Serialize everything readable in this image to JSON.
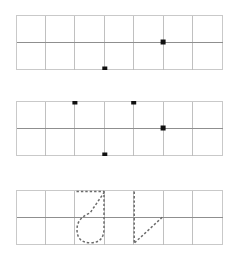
{
  "worksheet": {
    "title": "Handwriting practice grid worksheet",
    "background_color": "#ffffff",
    "grid_line_color": "#b9b9b9",
    "midline_color": "#8f8f8f",
    "dot_color": "#111111",
    "guide_stroke_color": "#6b6b6b",
    "columns": 7,
    "rows": 2,
    "row_count": 3,
    "geometry": {
      "left": 16,
      "right": 222,
      "width": 206,
      "col_width": 29.43,
      "row_heights": [
        27,
        27
      ],
      "band_tops": [
        15,
        101,
        190
      ],
      "band_height": 54
    },
    "bands": [
      {
        "name": "band-one",
        "index": 1,
        "top": 15,
        "dots": [
          {
            "name": "dot-mid-col6",
            "col": 5,
            "line": "middle",
            "x": 163.1,
            "y": 42
          },
          {
            "name": "dot-bottom-col4",
            "col": 3,
            "line": "bottom",
            "x": 104.8,
            "y": 69
          }
        ],
        "guides": []
      },
      {
        "name": "band-two",
        "index": 2,
        "top": 101,
        "dots": [
          {
            "name": "dot-top-col3",
            "col": 2,
            "line": "top",
            "x": 75.4,
            "y": 101
          },
          {
            "name": "dot-top-col5",
            "col": 4,
            "line": "top",
            "x": 133.7,
            "y": 101
          },
          {
            "name": "dot-mid-col6",
            "col": 5,
            "line": "middle",
            "x": 163.1,
            "y": 128
          },
          {
            "name": "dot-bottom-col4",
            "col": 3,
            "line": "bottom",
            "x": 104.8,
            "y": 155
          }
        ],
        "guides": []
      },
      {
        "name": "band-three",
        "index": 3,
        "top": 190,
        "dots": [],
        "guides": [
          {
            "name": "guide-letter-j",
            "glyph": "J",
            "style": "dashed",
            "description": "Dashed cursive J: top bar, diagonal descending stroke, bowl hook and right stem"
          },
          {
            "name": "guide-letter-v",
            "glyph": "V",
            "style": "dashed",
            "description": "Dashed V: vertical down stroke and rising diagonal"
          }
        ]
      }
    ]
  }
}
